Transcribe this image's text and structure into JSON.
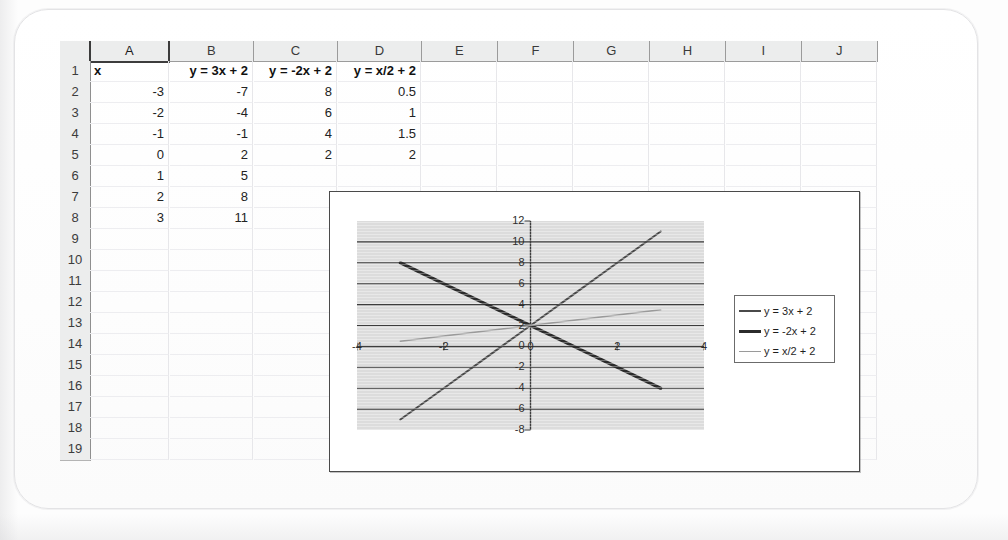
{
  "app": {
    "type": "spreadsheet",
    "columns": [
      "A",
      "B",
      "C",
      "D",
      "E",
      "F",
      "G",
      "H",
      "I",
      "J"
    ],
    "selected_column": "A",
    "row_numbers": [
      "1",
      "2",
      "3",
      "4",
      "5",
      "6",
      "7",
      "8",
      "9",
      "10",
      "11",
      "12",
      "13",
      "14",
      "15",
      "16",
      "17",
      "18",
      "19"
    ]
  },
  "sheet": {
    "header_row": {
      "A": "x",
      "B": "y = 3x + 2",
      "C": "y = -2x + 2",
      "D": "y = x/2 + 2"
    },
    "rows": [
      {
        "row": "2",
        "A": "-3",
        "B": "-7",
        "C": "8",
        "D": "0.5"
      },
      {
        "row": "3",
        "A": "-2",
        "B": "-4",
        "C": "6",
        "D": "1"
      },
      {
        "row": "4",
        "A": "-1",
        "B": "-1",
        "C": "4",
        "D": "1.5"
      },
      {
        "row": "5",
        "A": "0",
        "B": "2",
        "C": "2",
        "D": "2"
      },
      {
        "row": "6",
        "A": "1",
        "B": "5",
        "C": "",
        "D": ""
      },
      {
        "row": "7",
        "A": "2",
        "B": "8",
        "C": "",
        "D": ""
      },
      {
        "row": "8",
        "A": "3",
        "B": "11",
        "C": "",
        "D": ""
      }
    ],
    "empty_rows": [
      "9",
      "10",
      "11",
      "12",
      "13",
      "14",
      "15",
      "16",
      "17",
      "18",
      "19"
    ]
  },
  "chart_data": {
    "type": "line",
    "title": "",
    "xlabel": "",
    "ylabel": "",
    "xlim": [
      -4,
      4
    ],
    "ylim": [
      -8,
      12
    ],
    "x_ticks": [
      "-4",
      "-2",
      "0",
      "2",
      "4"
    ],
    "x_tick_values": [
      -4,
      -2,
      0,
      2,
      4
    ],
    "y_ticks": [
      "12",
      "10",
      "8",
      "6",
      "4",
      "2",
      "0",
      "-2",
      "-4",
      "-6",
      "-8"
    ],
    "y_tick_values": [
      12,
      10,
      8,
      6,
      4,
      2,
      0,
      -2,
      -4,
      -6,
      -8
    ],
    "grid": "horizontal",
    "legend_position": "right",
    "plot_background": "#dcdcdc",
    "x": [
      -3,
      -2,
      -1,
      0,
      1,
      2,
      3
    ],
    "series": [
      {
        "name": "y = 3x + 2",
        "values": [
          -7,
          -4,
          -1,
          2,
          5,
          8,
          11
        ],
        "color": "#4a4a4a",
        "width": 2.0
      },
      {
        "name": "y = -2x + 2",
        "values": [
          8,
          6,
          4,
          2,
          0,
          -2,
          -4
        ],
        "color": "#2b2b2b",
        "width": 3.2
      },
      {
        "name": "y = x/2 + 2",
        "values": [
          0.5,
          1,
          1.5,
          2,
          2.5,
          3,
          3.5
        ],
        "color": "#9a9a9a",
        "width": 1.6
      }
    ]
  },
  "colors": {
    "grid_line": "#e7e7ea",
    "header_fill": "#eceded",
    "chart_border": "#4a4a4a",
    "plot_bg": "#dcdcdc",
    "gridline": "#3d3d3d"
  }
}
